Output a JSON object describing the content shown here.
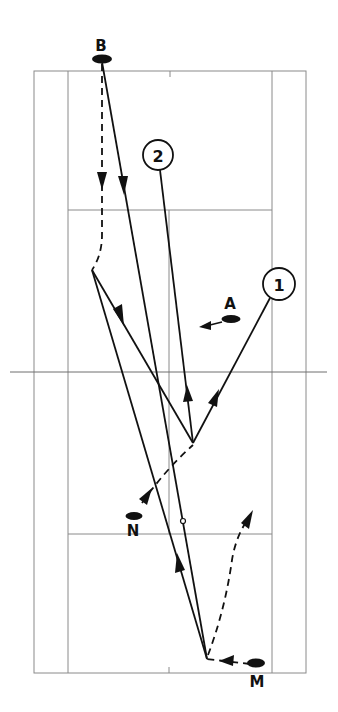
{
  "diagram": {
    "type": "badminton-court-play-diagram",
    "colors": {
      "lines": "#8a8a8a",
      "ink": "#111111",
      "background": "#ffffff"
    }
  },
  "players": [
    {
      "id": "B",
      "label": "B"
    },
    {
      "id": "A",
      "label": "A"
    },
    {
      "id": "N",
      "label": "N"
    },
    {
      "id": "M",
      "label": "M"
    }
  ],
  "markers": [
    {
      "id": "1",
      "label": "1"
    },
    {
      "id": "2",
      "label": "2"
    }
  ],
  "legend": {
    "solid_line": "shuttle flight",
    "dashed_line": "player movement"
  }
}
